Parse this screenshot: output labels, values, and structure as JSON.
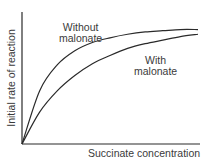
{
  "chart_data": {
    "type": "line",
    "title": "",
    "xlabel": "Succinate concentration",
    "ylabel": "Initial rate of reaction",
    "grid": false,
    "legend": "inline annotations",
    "axis_ticks": false,
    "series": [
      {
        "name": "Without malonate",
        "label_lines": [
          "Without",
          "malonate"
        ],
        "x": [
          0,
          0.1,
          0.2,
          0.3,
          0.4,
          0.5,
          0.6,
          0.7,
          0.8,
          0.9,
          1.0
        ],
        "y": [
          0,
          0.45,
          0.67,
          0.79,
          0.86,
          0.9,
          0.93,
          0.95,
          0.96,
          0.97,
          0.97
        ]
      },
      {
        "name": "With malonate",
        "label_lines": [
          "With",
          "malonate"
        ],
        "x": [
          0,
          0.1,
          0.2,
          0.3,
          0.4,
          0.5,
          0.6,
          0.7,
          0.8,
          0.9,
          1.0
        ],
        "y": [
          0,
          0.27,
          0.45,
          0.58,
          0.68,
          0.75,
          0.81,
          0.85,
          0.88,
          0.91,
          0.93
        ]
      }
    ],
    "xlim": [
      0,
      1
    ],
    "ylim": [
      0,
      1
    ]
  }
}
